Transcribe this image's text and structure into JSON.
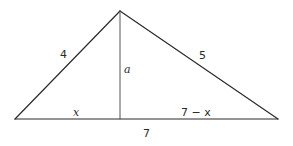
{
  "diagram": {
    "type": "triangle-with-altitude",
    "vertices": {
      "apex": [
        120,
        11
      ],
      "base_left": [
        15,
        119
      ],
      "base_right": [
        278,
        119
      ],
      "altitude_foot": [
        120,
        119
      ]
    },
    "labels": {
      "left_side": "4",
      "right_side": "5",
      "altitude": "a",
      "base_left_segment": "x",
      "base_right_segment": "7 − x",
      "base_total": "7"
    },
    "colors": {
      "stroke": "#2b2b2b",
      "altitude_stroke": "#555555",
      "background": "#ffffff"
    }
  }
}
